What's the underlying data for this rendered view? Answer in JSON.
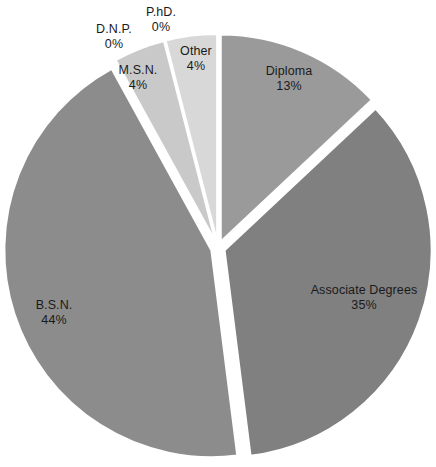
{
  "chart_data": {
    "type": "pie",
    "title": "",
    "subtitle": "",
    "xlabel": "",
    "ylabel": "",
    "legend": "none",
    "grid": false,
    "labels_show_percent": true,
    "categories": [
      "Diploma",
      "Associate Degrees",
      "B.S.N.",
      "M.S.N.",
      "D.N.P.",
      "P.hD.",
      "Other"
    ],
    "values": [
      13,
      35,
      44,
      4,
      0,
      0,
      4
    ],
    "value_labels": [
      "13%",
      "35%",
      "44%",
      "4%",
      "0%",
      "0%",
      "4%"
    ],
    "colors": [
      "#9a9a9a",
      "#808080",
      "#8c8c8c",
      "#c9c9c9",
      "#cfcfcf",
      "#d2d2d2",
      "#d8d8d8"
    ],
    "slice_gap_color": "#ffffff",
    "slices": [
      {
        "name": "Diploma",
        "value": 13,
        "value_label": "13%",
        "color": "#9a9a9a"
      },
      {
        "name": "Associate Degrees",
        "value": 35,
        "value_label": "35%",
        "color": "#808080"
      },
      {
        "name": "B.S.N.",
        "value": 44,
        "value_label": "44%",
        "color": "#8c8c8c"
      },
      {
        "name": "M.S.N.",
        "value": 4,
        "value_label": "4%",
        "color": "#c9c9c9"
      },
      {
        "name": "D.N.P.",
        "value": 0,
        "value_label": "0%",
        "color": "#cfcfcf"
      },
      {
        "name": "P.hD.",
        "value": 0,
        "value_label": "0%",
        "color": "#d2d2d2"
      },
      {
        "name": "Other",
        "value": 4,
        "value_label": "4%",
        "color": "#d8d8d8"
      }
    ]
  },
  "labels": {
    "diploma": {
      "name": "Diploma",
      "value": "13%"
    },
    "associate": {
      "name": "Associate Degrees",
      "value": "35%"
    },
    "bsn": {
      "name": "B.S.N.",
      "value": "44%"
    },
    "msn": {
      "name": "M.S.N.",
      "value": "4%"
    },
    "dnp": {
      "name": "D.N.P.",
      "value": "0%"
    },
    "phd": {
      "name": "P.hD.",
      "value": "0%"
    },
    "other": {
      "name": "Other",
      "value": "4%"
    }
  }
}
